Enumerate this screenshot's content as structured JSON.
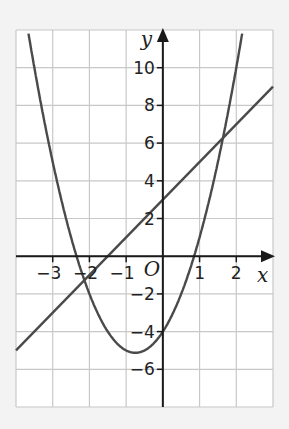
{
  "chart_data": {
    "type": "line",
    "title": "",
    "xlabel": "x",
    "ylabel": "y",
    "origin_label": "O",
    "xlim": [
      -4,
      3
    ],
    "ylim": [
      -8,
      12
    ],
    "grid": true,
    "x_ticks": [
      -3,
      -2,
      -1,
      1,
      2
    ],
    "y_ticks": [
      -6,
      -4,
      -2,
      2,
      4,
      6,
      8,
      10
    ],
    "x_tick_labels": [
      "−3",
      "−2",
      "−1",
      "1",
      "2"
    ],
    "y_tick_labels": [
      "−6",
      "−4",
      "−2",
      "2",
      "4",
      "6",
      "8",
      "10"
    ],
    "series": [
      {
        "name": "parabola",
        "equation": "y = 2x^2 + 3x - 4",
        "a": 2,
        "b": 3,
        "c": -4,
        "vertex": [
          -0.75,
          -5.125
        ]
      },
      {
        "name": "line",
        "equation": "y = 2x + 3",
        "m": 2,
        "c": 3
      }
    ],
    "intersections": [
      [
        -2.14,
        -1.28
      ],
      [
        1.64,
        6.28
      ]
    ]
  },
  "colors": {
    "curve": "#4a4a4a",
    "axis": "#1a1a1a",
    "grid": "#c8c8c8",
    "background": "#ffffff",
    "page": "#f3f3f3"
  }
}
